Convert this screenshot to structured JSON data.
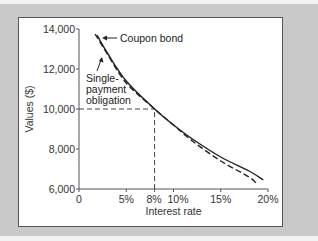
{
  "chart_data": {
    "type": "line",
    "title": "",
    "xlabel": "Interest rate",
    "ylabel": "Values ($)",
    "xlim": [
      0,
      20
    ],
    "ylim": [
      6000,
      14000
    ],
    "x_ticks": [
      {
        "value": 0,
        "label": "0"
      },
      {
        "value": 5,
        "label": "5%"
      },
      {
        "value": 8,
        "label": "8%"
      },
      {
        "value": 10,
        "label": "10%"
      },
      {
        "value": 15,
        "label": "15%"
      },
      {
        "value": 20,
        "label": "20%"
      }
    ],
    "y_ticks": [
      {
        "value": 6000,
        "label": "6,000"
      },
      {
        "value": 8000,
        "label": "8,000"
      },
      {
        "value": 10000,
        "label": "10,000"
      },
      {
        "value": 12000,
        "label": "12,000"
      },
      {
        "value": 14000,
        "label": "14,000"
      }
    ],
    "grid": false,
    "series": [
      {
        "name": "Coupon bond",
        "style": "solid",
        "x": [
          1.9,
          3,
          5,
          8,
          10,
          12,
          15,
          18,
          19.5
        ],
        "values": [
          13700,
          12800,
          11400,
          10000,
          9200,
          8500,
          7600,
          6900,
          6450
        ]
      },
      {
        "name": "Single-payment obligation",
        "style": "dashed",
        "x": [
          1.7,
          3,
          5,
          8,
          10,
          12,
          15,
          18,
          18.8
        ],
        "values": [
          13750,
          12750,
          11300,
          10000,
          9200,
          8400,
          7400,
          6600,
          6250
        ]
      }
    ],
    "reference_lines": [
      {
        "type": "horizontal",
        "y": 10000,
        "x_from": 0,
        "x_to": 8,
        "style": "dashed"
      },
      {
        "type": "vertical",
        "x": 8,
        "y_from": 6000,
        "y_to": 10000,
        "style": "dashed"
      }
    ],
    "annotations": [
      {
        "text": "Coupon bond",
        "points_to": "Coupon bond"
      },
      {
        "text_lines": [
          "Single-",
          "payment",
          "obligation"
        ],
        "points_to": "Single-payment obligation"
      }
    ]
  },
  "colors": {
    "background": "#c9c9c9",
    "panel": "#ffffff",
    "line": "#222222",
    "axis": "#555555"
  }
}
